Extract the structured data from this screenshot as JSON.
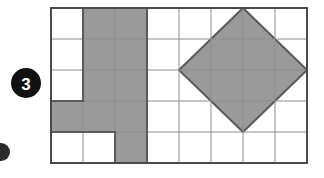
{
  "figure": {
    "kind": "grid-shapes-diagram",
    "background_color": "#ffffff"
  },
  "question_badge": {
    "label": "3",
    "shape": "filled-circle",
    "circle_color": "#111111",
    "text_color": "#ffffff",
    "center_x": 26,
    "center_y": 83,
    "radius": 15
  },
  "partial_badge": {
    "shape": "filled-circle-clipped",
    "circle_color": "#2b2b2b",
    "center_x": 1,
    "center_y": 152,
    "radius": 9
  },
  "grid": {
    "columns": 8,
    "rows": 5,
    "origin_x": 51,
    "origin_y": 8,
    "cell_width": 32,
    "cell_height": 31,
    "total_width": 256,
    "total_height": 155,
    "inner_line_color": "#8d8d8d",
    "inner_line_width": 1,
    "border_color": "#4a4a4a",
    "border_width": 2,
    "cell_fill_empty": "#ffffff"
  },
  "colors": {
    "shaded_fill": "#9a9a9a",
    "shaded_outline": "#5a5a5a",
    "grid_line": "#8d8d8d",
    "grid_border": "#4a4a4a",
    "badge_fill": "#111111",
    "badge_text": "#ffffff"
  },
  "shapes": [
    {
      "name": "shaded-polyomino",
      "type": "cell-region",
      "fill": "#9a9a9a",
      "outline": "#5a5a5a",
      "cell_count": 10,
      "cells": [
        {
          "col": 2,
          "row": 1
        },
        {
          "col": 3,
          "row": 1
        },
        {
          "col": 2,
          "row": 2
        },
        {
          "col": 3,
          "row": 2
        },
        {
          "col": 2,
          "row": 3
        },
        {
          "col": 3,
          "row": 3
        },
        {
          "col": 1,
          "row": 4
        },
        {
          "col": 2,
          "row": 4
        },
        {
          "col": 3,
          "row": 4
        },
        {
          "col": 3,
          "row": 5
        }
      ],
      "outline_path": "M 83,8 L 147,8 L 147,132 L 147,163 L 115,163 L 115,132 L 51,132 L 51,101 L 83,101 Z"
    },
    {
      "name": "shaded-diamond",
      "type": "polygon",
      "fill": "#9a9a9a",
      "outline": "#5a5a5a",
      "outline_width": 2,
      "vertices": [
        {
          "x": 243,
          "y": 8
        },
        {
          "x": 307,
          "y": 70
        },
        {
          "x": 243,
          "y": 132
        },
        {
          "x": 179,
          "y": 70
        }
      ],
      "spans_columns": [
        5,
        8
      ],
      "spans_rows": [
        1,
        4
      ],
      "diagonal_cells_wide": 4,
      "diagonal_cells_tall": 4
    }
  ]
}
